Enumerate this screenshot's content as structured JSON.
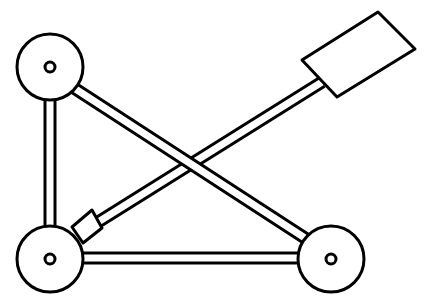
{
  "diagram": {
    "stroke_color": "#000000",
    "fill_color": "#ffffff",
    "stroke_width": 3,
    "wheels": [
      {
        "id": "top-left",
        "cx": 50,
        "cy": 67,
        "r": 33,
        "hub_r": 5
      },
      {
        "id": "bottom-left",
        "cx": 50,
        "cy": 259,
        "r": 33,
        "hub_r": 5
      },
      {
        "id": "bottom-right",
        "cx": 331,
        "cy": 259,
        "r": 33,
        "hub_r": 5
      }
    ],
    "struts": [
      {
        "id": "left-vertical",
        "x1": 50,
        "y1": 98,
        "x2": 50,
        "y2": 228,
        "width": 13
      },
      {
        "id": "bottom-horizontal",
        "x1": 81,
        "y1": 258,
        "x2": 300,
        "y2": 258,
        "width": 13
      }
    ],
    "arm": {
      "id": "throwing-arm",
      "x1": 95,
      "y1": 224,
      "x2": 322,
      "y2": 82,
      "width": 13
    },
    "diagonal": {
      "id": "diagonal-brace",
      "x1": 74,
      "y1": 88,
      "x2": 308,
      "y2": 240,
      "width": 13
    },
    "pivot_block": {
      "points": "92,210 102,228 83,243 72,227"
    },
    "bucket": {
      "points": "378,12 415,49 337,97 302,60"
    }
  }
}
